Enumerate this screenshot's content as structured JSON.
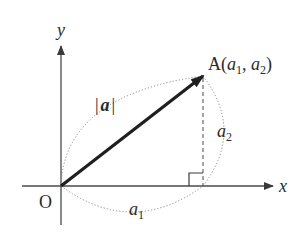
{
  "diagram": {
    "axes": {
      "x_label": "x",
      "y_label": "y",
      "origin_label": "O"
    },
    "point": {
      "name": "A",
      "open_paren": "(",
      "coord1_base": "a",
      "coord1_sub": "1",
      "comma": ", ",
      "coord2_base": "a",
      "coord2_sub": "2",
      "close_paren": ")"
    },
    "vector_magnitude": {
      "bar_left": "|",
      "symbol": "a",
      "bar_right": "|"
    },
    "component_x": {
      "base": "a",
      "sub": "1"
    },
    "component_y": {
      "base": "a",
      "sub": "2"
    },
    "colors": {
      "axis": "#4a4a4a",
      "vector": "#1f1f1f",
      "dotted": "#8a8a8a",
      "text": "#2a2a2a"
    }
  }
}
